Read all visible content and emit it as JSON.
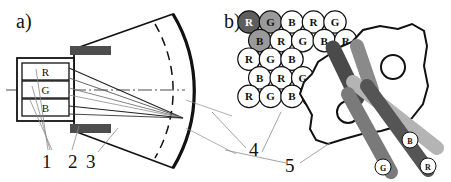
{
  "figure": {
    "panel_a": {
      "label": "a)",
      "source_boxes": [
        {
          "id": "box-r",
          "text": "R"
        },
        {
          "id": "box-g",
          "text": "G"
        },
        {
          "id": "box-b",
          "text": "B"
        }
      ],
      "callouts": [
        {
          "id": "callout-1",
          "text": "1"
        },
        {
          "id": "callout-2",
          "text": "2"
        },
        {
          "id": "callout-3",
          "text": "3"
        }
      ],
      "elements": {
        "aperture_blocks": 2,
        "fan_beam": "sector",
        "axis_style": "dash-dot",
        "dashed_arc": true
      }
    },
    "panel_b": {
      "label": "b)",
      "callouts": [
        {
          "id": "callout-4",
          "text": "4"
        },
        {
          "id": "callout-5",
          "text": "5"
        }
      ],
      "grid": {
        "rows": [
          {
            "offset": 0,
            "cells": [
              {
                "text": "R",
                "fill": "#5e5e5e",
                "label_color": "#ffffff"
              },
              {
                "text": "G",
                "fill": "#9a9a9a",
                "label_color": "#111111"
              },
              {
                "text": "B",
                "fill": "#ffffff",
                "label_color": "#111111"
              },
              {
                "text": "R",
                "fill": "#ffffff",
                "label_color": "#111111"
              },
              {
                "text": "G",
                "fill": "#ffffff",
                "label_color": "#111111"
              }
            ]
          },
          {
            "offset": 1,
            "cells": [
              {
                "text": "B",
                "fill": "#9a9a9a",
                "label_color": "#111111"
              },
              {
                "text": "R",
                "fill": "#ffffff",
                "label_color": "#111111"
              },
              {
                "text": "G",
                "fill": "#ffffff",
                "label_color": "#111111"
              },
              {
                "text": "B",
                "fill": "#ffffff",
                "label_color": "#111111"
              },
              {
                "text": "R",
                "fill": "#ffffff",
                "label_color": "#111111"
              }
            ]
          },
          {
            "offset": 0,
            "cells": [
              {
                "text": "R",
                "fill": "#ffffff",
                "label_color": "#111111"
              },
              {
                "text": "G",
                "fill": "#ffffff",
                "label_color": "#111111"
              },
              {
                "text": "B",
                "fill": "#ffffff",
                "label_color": "#111111"
              },
              {
                "text": "",
                "fill": "#ffffff",
                "label_color": "#111111"
              },
              {
                "text": "",
                "fill": "#ffffff",
                "label_color": "#111111"
              }
            ]
          },
          {
            "offset": 1,
            "cells": [
              {
                "text": "B",
                "fill": "#ffffff",
                "label_color": "#111111"
              },
              {
                "text": "R",
                "fill": "#ffffff",
                "label_color": "#111111"
              },
              {
                "text": "G",
                "fill": "#ffffff",
                "label_color": "#111111"
              },
              {
                "text": "",
                "fill": "#ffffff",
                "label_color": "#111111"
              }
            ]
          },
          {
            "offset": 0,
            "cells": [
              {
                "text": "R",
                "fill": "#ffffff",
                "label_color": "#111111"
              },
              {
                "text": "G",
                "fill": "#ffffff",
                "label_color": "#111111"
              },
              {
                "text": "B",
                "fill": "#ffffff",
                "label_color": "#111111"
              },
              {
                "text": "R",
                "fill": "#ffffff",
                "label_color": "#111111"
              }
            ]
          }
        ]
      },
      "rods": [
        {
          "id": "rod-dark",
          "text": "",
          "fill": "#4a4a4a"
        },
        {
          "id": "rod-mid",
          "text": "",
          "fill": "#8a8a8a"
        },
        {
          "id": "rod-b",
          "text": "B",
          "fill": "#b4b4b4"
        },
        {
          "id": "rod-g",
          "text": "G",
          "fill": "#7a7a7a"
        },
        {
          "id": "rod-r",
          "text": "R",
          "fill": "#555555"
        }
      ],
      "blob": {
        "inner_circles": 2
      }
    }
  },
  "colors": {
    "stroke": "#111111",
    "thin_line": "#8c8c8c",
    "block_fill": "#4d4d4d",
    "highlight_dark": "#5e5e5e",
    "highlight_mid": "#9a9a9a"
  }
}
